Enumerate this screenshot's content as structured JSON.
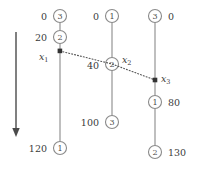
{
  "figure": {
    "background": "#ffffff",
    "line_color": "#7a7a7a",
    "text_color": "#3a3a3a",
    "arrow_color": "#4a4a4a"
  },
  "time_arrow": {
    "name": "downward-time-arrow",
    "x": 16,
    "y_start": 32,
    "y_end": 136,
    "direction": "down"
  },
  "timelines": [
    {
      "id": "process-1",
      "x": 60,
      "y_top": 16,
      "y_bottom": 148,
      "nodes": [
        {
          "id": "p1-n1",
          "value": "3",
          "time": "0",
          "cx": 60,
          "cy": 16,
          "label_side": "left"
        },
        {
          "id": "p1-n2",
          "value": "2",
          "time": "20",
          "cx": 60,
          "cy": 37,
          "label_side": "left"
        },
        {
          "id": "p1-n3",
          "value": "1",
          "time": "120",
          "cx": 60,
          "cy": 148,
          "label_side": "left"
        }
      ]
    },
    {
      "id": "process-2",
      "x": 112,
      "y_top": 16,
      "y_bottom": 122,
      "nodes": [
        {
          "id": "p2-n1",
          "value": "1",
          "time": "0",
          "cx": 112,
          "cy": 16,
          "label_side": "left"
        },
        {
          "id": "p2-n2",
          "value": "2",
          "time": "40",
          "cx": 112,
          "cy": 64,
          "label_side": "left"
        },
        {
          "id": "p2-n3",
          "value": "3",
          "time": "100",
          "cx": 112,
          "cy": 122,
          "label_side": "left"
        }
      ]
    },
    {
      "id": "process-3",
      "x": 155,
      "y_top": 16,
      "y_bottom": 152,
      "nodes": [
        {
          "id": "p3-n1",
          "value": "3",
          "time": "0",
          "cx": 155,
          "cy": 16,
          "label_side": "right"
        },
        {
          "id": "p3-n2",
          "value": "1",
          "time": "80",
          "cx": 155,
          "cy": 102,
          "label_side": "right"
        },
        {
          "id": "p3-n3",
          "value": "2",
          "time": "130",
          "cx": 155,
          "cy": 152,
          "label_side": "right"
        }
      ]
    }
  ],
  "cut_points": [
    {
      "id": "x1",
      "label": "x",
      "subscript": "1",
      "x": 60,
      "y": 51,
      "label_x": 39,
      "label_y": 58
    },
    {
      "id": "x2",
      "label": "x",
      "subscript": "2",
      "x": 112,
      "y": 64,
      "label_x": 122,
      "label_y": 62
    },
    {
      "id": "x3",
      "label": "x",
      "subscript": "3",
      "x": 155,
      "y": 80,
      "label_x": 161,
      "label_y": 80
    }
  ],
  "cut_line": {
    "name": "consistent-cut-line",
    "style": "dotted",
    "points": "60,51 112,64 155,80"
  },
  "node_radius": 6.5
}
